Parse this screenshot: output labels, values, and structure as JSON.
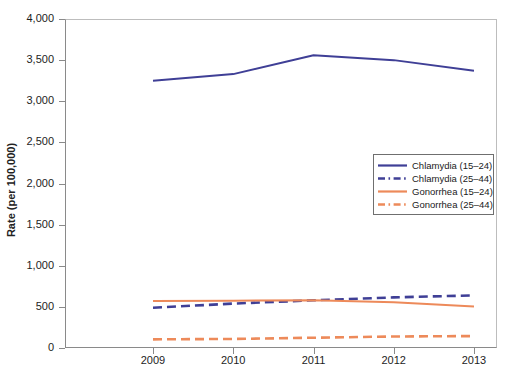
{
  "chart_data": {
    "type": "line",
    "title": "",
    "xlabel": "",
    "ylabel": "Rate (per 100,000)",
    "x": [
      "2009",
      "2010",
      "2011",
      "2012",
      "2013"
    ],
    "xlim": [
      2008.5,
      2013.5
    ],
    "ylim": [
      0,
      4000
    ],
    "yticks": [
      "0",
      "500",
      "1,000",
      "1,500",
      "2,000",
      "2,500",
      "3,000",
      "3,500",
      "4,000"
    ],
    "ytick_values": [
      0,
      500,
      1000,
      1500,
      2000,
      2500,
      3000,
      3500,
      4000
    ],
    "grid": false,
    "legend_position": "center-right",
    "series": [
      {
        "name": "Chlamydia (15–24)",
        "color": "#3f3f96",
        "style": "solid",
        "values": [
          3250,
          3330,
          3560,
          3500,
          3370
        ]
      },
      {
        "name": "Chlamydia (25–44)",
        "color": "#3f3f96",
        "style": "dashed",
        "values": [
          490,
          540,
          580,
          615,
          640
        ]
      },
      {
        "name": "Gonorrhea (15–24)",
        "color": "#ed8a5a",
        "style": "solid",
        "values": [
          570,
          575,
          580,
          555,
          505
        ]
      },
      {
        "name": "Gonorrhea (25–44)",
        "color": "#ed8a5a",
        "style": "dashed",
        "values": [
          105,
          110,
          125,
          140,
          145
        ]
      }
    ]
  },
  "legend": {
    "items": [
      {
        "label": "Chlamydia (15–24)"
      },
      {
        "label": "Chlamydia (25–44)"
      },
      {
        "label": "Gonorrhea (15–24)"
      },
      {
        "label": "Gonorrhea (25–44)"
      }
    ]
  },
  "axes": {
    "y_title": "Rate (per 100,000)",
    "y_labels": [
      "4,000",
      "3,500",
      "3,000",
      "2,500",
      "2,000",
      "1,500",
      "1,000",
      "500",
      "0"
    ],
    "x_labels": [
      "2009",
      "2010",
      "2011",
      "2012",
      "2013"
    ]
  }
}
